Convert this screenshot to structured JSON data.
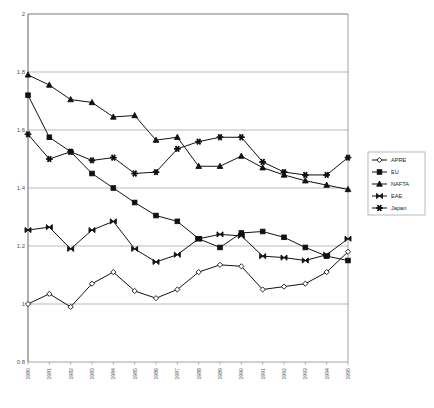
{
  "chart_data": {
    "type": "line",
    "title": "",
    "subtitle": "",
    "xlabel": "",
    "ylabel": "",
    "ylim": [
      0.8,
      2.0
    ],
    "ytick_labels": [
      "0.8",
      "1",
      "1.2",
      "1.4",
      "1.6",
      "1.8",
      "2"
    ],
    "ytick_values": [
      0.8,
      1.0,
      1.2,
      1.4,
      1.6,
      1.8,
      2.0
    ],
    "grid": true,
    "legend_position": "right",
    "x": [
      1980,
      1981,
      1982,
      1983,
      1984,
      1985,
      1986,
      1987,
      1988,
      1989,
      1990,
      1991,
      1992,
      1993,
      1994,
      1995
    ],
    "categories": [
      "1980",
      "1981",
      "1982",
      "1983",
      "1984",
      "1985",
      "1986",
      "1987",
      "1988",
      "1989",
      "1990",
      "1991",
      "1992",
      "1993",
      "1994",
      "1995"
    ],
    "series": [
      {
        "name": "APRE",
        "marker": "open-diamond",
        "values": [
          1.0,
          1.035,
          0.99,
          1.07,
          1.11,
          1.045,
          1.02,
          1.05,
          1.11,
          1.135,
          1.13,
          1.05,
          1.06,
          1.07,
          1.11,
          1.18
        ]
      },
      {
        "name": "EU",
        "marker": "filled-square",
        "values": [
          1.72,
          1.575,
          1.525,
          1.45,
          1.4,
          1.35,
          1.305,
          1.285,
          1.225,
          1.195,
          1.245,
          1.25,
          1.23,
          1.195,
          1.165,
          1.15
        ]
      },
      {
        "name": "NAFTA",
        "marker": "filled-triangle",
        "values": [
          1.79,
          1.755,
          1.705,
          1.695,
          1.645,
          1.65,
          1.565,
          1.575,
          1.475,
          1.475,
          1.51,
          1.47,
          1.445,
          1.425,
          1.41,
          1.395
        ]
      },
      {
        "name": "EAE",
        "marker": "bowtie-x",
        "values": [
          1.255,
          1.265,
          1.19,
          1.255,
          1.285,
          1.19,
          1.145,
          1.17,
          1.225,
          1.24,
          1.235,
          1.165,
          1.16,
          1.15,
          1.17,
          1.225
        ]
      },
      {
        "name": "Japan",
        "marker": "asterisk-star",
        "values": [
          1.585,
          1.5,
          1.525,
          1.495,
          1.505,
          1.45,
          1.455,
          1.535,
          1.56,
          1.575,
          1.575,
          1.49,
          1.455,
          1.445,
          1.445,
          1.505
        ]
      }
    ],
    "legend_entries": [
      "APRE",
      "EU",
      "NAFTA",
      "EAE",
      "Japan"
    ],
    "colors": {
      "series_stroke": "#111111",
      "gridline": "#8a8a8a",
      "axis": "#6e6e6e",
      "background": "#ffffff",
      "tick_text": "#555555"
    }
  }
}
